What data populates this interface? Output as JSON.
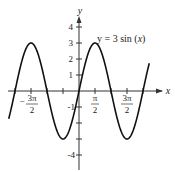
{
  "chart_data": {
    "type": "line",
    "xlabel": "x",
    "ylabel": "y",
    "function": "3*sin(x)",
    "x_range": [
      -6.9,
      6.9
    ],
    "ylim": [
      -4.5,
      4.5
    ],
    "grid": false,
    "legend": null,
    "annotation": "y = 3 sin (x)",
    "x_ticks": [
      {
        "value": -4.712,
        "label": "-3π/2"
      },
      {
        "value": 1.5708,
        "label": "π/2"
      },
      {
        "value": 4.712,
        "label": "3π/2"
      }
    ],
    "y_ticks": [
      {
        "value": 4,
        "label": "4"
      },
      {
        "value": 3,
        "label": "3"
      },
      {
        "value": 2,
        "label": "2"
      },
      {
        "value": 1,
        "label": "1"
      },
      {
        "value": -1,
        "label": "-1"
      },
      {
        "value": -4,
        "label": "-4"
      }
    ],
    "series": [
      {
        "name": "y = 3 sin(x)",
        "x": [
          -6.28,
          -4.712,
          -3.1416,
          -1.5708,
          0,
          1.5708,
          3.1416,
          4.712,
          6.28
        ],
        "values": [
          0,
          3,
          0,
          -3,
          0,
          3,
          0,
          -3,
          0
        ]
      }
    ]
  },
  "labels": {
    "equation_prefix": "y = 3 sin (",
    "equation_var": "x",
    "equation_suffix": ")",
    "x_axis": "x",
    "y_axis": "y",
    "y4": "4",
    "y3": "3",
    "y2": "2",
    "y1": "1",
    "ym1": "-1",
    "ym4": "-4",
    "pi": "π",
    "three_pi": "3π",
    "two": "2",
    "minus": "−"
  }
}
